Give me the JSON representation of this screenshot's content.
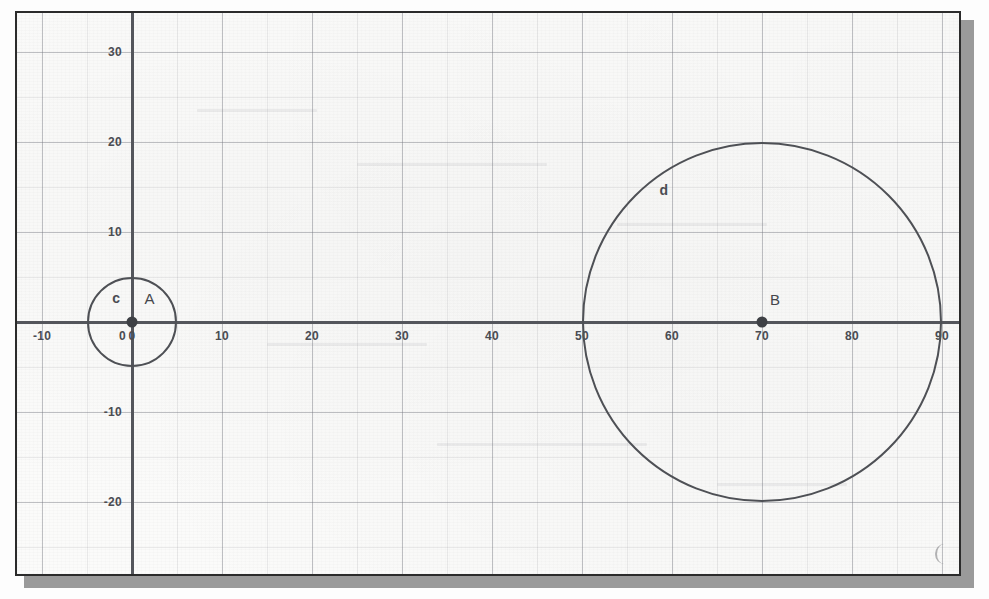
{
  "figure": {
    "background_color": "#fbfbfa",
    "border_color": "#2b2b2b",
    "shadow_color": "#9a9a9a"
  },
  "chart_data": {
    "type": "scatter",
    "title": "",
    "subtitle": "",
    "xlabel": "",
    "ylabel": "",
    "xlim": [
      -14,
      94
    ],
    "ylim": [
      -32,
      34
    ],
    "grid": true,
    "grid_major_step": 10,
    "grid_minor_step": 5,
    "legend_position": "none",
    "axis_color": "#54565c",
    "curve_color": "#4e5055",
    "point_color": "#3e4045",
    "x_ticks": [
      -10,
      0,
      10,
      20,
      30,
      40,
      50,
      60,
      70,
      80,
      90
    ],
    "x_tick_labels": [
      "-10",
      "0",
      "10",
      "20",
      "30",
      "40",
      "50",
      "60",
      "70",
      "80",
      "90"
    ],
    "y_ticks": [
      30,
      20,
      10,
      -10,
      -20,
      -30
    ],
    "y_tick_labels": [
      "30",
      "20",
      "10",
      "-10",
      "-20",
      "-30"
    ],
    "points": [
      {
        "name": "A",
        "label": "A",
        "x": 0,
        "y": 0
      },
      {
        "name": "B",
        "label": "B",
        "x": 70,
        "y": 0
      }
    ],
    "circles": [
      {
        "name": "c",
        "label": "c",
        "center": [
          0,
          0
        ],
        "center_point": "A",
        "radius": 5,
        "label_x": -2.2,
        "label_y": 2.6
      },
      {
        "name": "d",
        "label": "d",
        "center": [
          70,
          0
        ],
        "center_point": "B",
        "radius": 20,
        "label_x": 58.6,
        "label_y": 14.6
      }
    ],
    "annotations": [
      {
        "text": "c",
        "x": -2.2,
        "y": 2.6
      },
      {
        "text": "A",
        "x": 1.4,
        "y": 2.6
      },
      {
        "text": "B",
        "x": 70.9,
        "y": 2.4
      },
      {
        "text": "d",
        "x": 58.6,
        "y": 14.6
      }
    ]
  }
}
